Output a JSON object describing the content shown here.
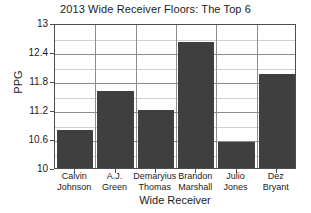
{
  "chart_data": {
    "type": "bar",
    "title": "2013 Wide Receiver Floors: The Top 6",
    "xlabel": "Wide Receiver",
    "ylabel": "PPG",
    "categories": [
      "Calvin Johnson",
      "A.J. Green",
      "Demaryius Thomas",
      "Brandon Marshall",
      "Julio Jones",
      "Dez Bryant"
    ],
    "category_lines": [
      [
        "Calvin",
        "Johnson"
      ],
      [
        "A.J.",
        "Green"
      ],
      [
        "Demaryius",
        "Thomas"
      ],
      [
        "Brandon",
        "Marshall"
      ],
      [
        "Julio",
        "Jones"
      ],
      [
        "Dez",
        "Bryant"
      ]
    ],
    "values": [
      10.79,
      11.59,
      11.2,
      12.61,
      10.54,
      11.95
    ],
    "ylim": [
      10,
      13
    ],
    "yticks": [
      10,
      10.6,
      11.2,
      11.8,
      12.4,
      13
    ],
    "ytick_labels": [
      "10",
      "10.6",
      "11.2",
      "11.8",
      "12.4",
      "13"
    ],
    "grid": true,
    "legend": "none",
    "bar_color": "#3f3f3f",
    "background_color": "#ffffff",
    "axis_color": "#4d4d4d"
  }
}
